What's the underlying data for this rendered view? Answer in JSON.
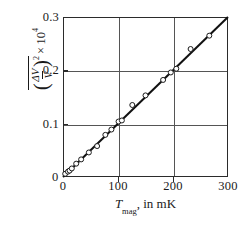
{
  "figure": {
    "name": "magnetic-noise-scatter-plot"
  },
  "chart_data": {
    "type": "scatter",
    "title": "",
    "subtitle": "",
    "xlabel": "T_mag, in mK",
    "xlabel_parts": {
      "symbol": "T",
      "subscript": "mag",
      "rest": ", in mK"
    },
    "ylabel": "mean of (ΔV/V)^2 × 10^4",
    "ylabel_parts": {
      "numerator": "ΔV",
      "denominator": "V",
      "exponent": "2",
      "times": "×",
      "power": "10",
      "power_exponent": "4",
      "overline": true
    },
    "xlim": [
      0,
      300
    ],
    "ylim": [
      0,
      0.3
    ],
    "xticks": [
      0,
      100,
      200,
      300
    ],
    "xtick_labels": [
      "0",
      "100",
      "200",
      "300"
    ],
    "yticks": [
      0,
      0.1,
      0.2,
      0.3
    ],
    "ytick_labels": [
      "0",
      "0.1",
      "0.2",
      "0.3"
    ],
    "grid": true,
    "grid_x_values": [
      100,
      200
    ],
    "grid_y_values": [
      0.1,
      0.2
    ],
    "legend": null,
    "marker": "open-circle",
    "marker_color": "#ffffff",
    "marker_edge_color": "#1a1a1a",
    "line_color": "#111111",
    "fit_line": {
      "name": "linear fit",
      "x": [
        0,
        300
      ],
      "y": [
        0.0,
        0.3
      ]
    },
    "series": [
      {
        "name": "measured data",
        "points": [
          {
            "x": 4,
            "y": 0.006
          },
          {
            "x": 9,
            "y": 0.01
          },
          {
            "x": 12,
            "y": 0.012
          },
          {
            "x": 16,
            "y": 0.016
          },
          {
            "x": 24,
            "y": 0.025
          },
          {
            "x": 33,
            "y": 0.033
          },
          {
            "x": 47,
            "y": 0.046
          },
          {
            "x": 62,
            "y": 0.058
          },
          {
            "x": 77,
            "y": 0.079
          },
          {
            "x": 88,
            "y": 0.089
          },
          {
            "x": 101,
            "y": 0.104
          },
          {
            "x": 107,
            "y": 0.106
          },
          {
            "x": 126,
            "y": 0.135
          },
          {
            "x": 150,
            "y": 0.153
          },
          {
            "x": 182,
            "y": 0.182
          },
          {
            "x": 196,
            "y": 0.196
          },
          {
            "x": 206,
            "y": 0.203
          },
          {
            "x": 232,
            "y": 0.24
          },
          {
            "x": 266,
            "y": 0.265
          }
        ]
      }
    ]
  },
  "axis": {
    "origin_label": "0"
  }
}
